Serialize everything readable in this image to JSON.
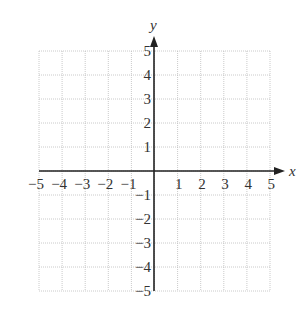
{
  "chart_data": {
    "type": "scatter",
    "title": "",
    "xlabel": "x",
    "ylabel": "y",
    "xlim": [
      -5,
      5
    ],
    "ylim": [
      -5,
      5
    ],
    "grid": true,
    "grid_style": "dotted",
    "x_ticks": [
      -5,
      -4,
      -3,
      -2,
      -1,
      1,
      2,
      3,
      4,
      5
    ],
    "y_ticks": [
      -5,
      -4,
      -3,
      -2,
      -1,
      1,
      2,
      3,
      4,
      5
    ],
    "x_tick_labels": [
      "−5",
      "−4",
      "−3",
      "−2",
      "−1",
      "1",
      "2",
      "3",
      "4",
      "5"
    ],
    "y_tick_labels": [
      "−5",
      "−4",
      "−3",
      "−2",
      "−1",
      "1",
      "2",
      "3",
      "4",
      "5"
    ],
    "series": [],
    "colors": {
      "grid": "#bdbdbd",
      "axis": "#222222",
      "text": "#333333"
    }
  }
}
